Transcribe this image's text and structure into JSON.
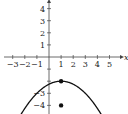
{
  "chart_data": {
    "type": "line",
    "title": "",
    "xlabel": "x",
    "ylabel": "y",
    "xlim": [
      -3.5,
      5.8
    ],
    "ylim": [
      -4.6,
      4.7
    ],
    "x_ticks": [
      -3,
      -2,
      -1,
      1,
      2,
      3,
      4,
      5
    ],
    "y_ticks": [
      4,
      3,
      2,
      1,
      -1,
      -2,
      -3,
      -4
    ],
    "x_tick_labels": [
      "−3",
      "−2",
      "−1",
      "1",
      "2",
      "3",
      "4",
      "5"
    ],
    "y_tick_labels_shown": [
      "4",
      "3",
      "2",
      "1",
      "−3",
      "−4"
    ],
    "grid": false,
    "series": [
      {
        "name": "parabola",
        "kind": "curve",
        "equation": "y = -(x-1)^2/4 - 2",
        "vertex": [
          1,
          -2
        ],
        "x": [
          -2.5,
          -2,
          -1,
          0,
          1,
          2,
          3,
          4,
          4.6
        ],
        "y": [
          -5.06,
          -4.25,
          -3,
          -2.25,
          -2,
          -2.25,
          -3,
          -4.25,
          -5.24
        ]
      },
      {
        "name": "vertex-point",
        "kind": "point",
        "x": [
          1
        ],
        "y": [
          -2
        ]
      },
      {
        "name": "isolated-point",
        "kind": "point",
        "x": [
          1
        ],
        "y": [
          -4
        ]
      }
    ]
  }
}
